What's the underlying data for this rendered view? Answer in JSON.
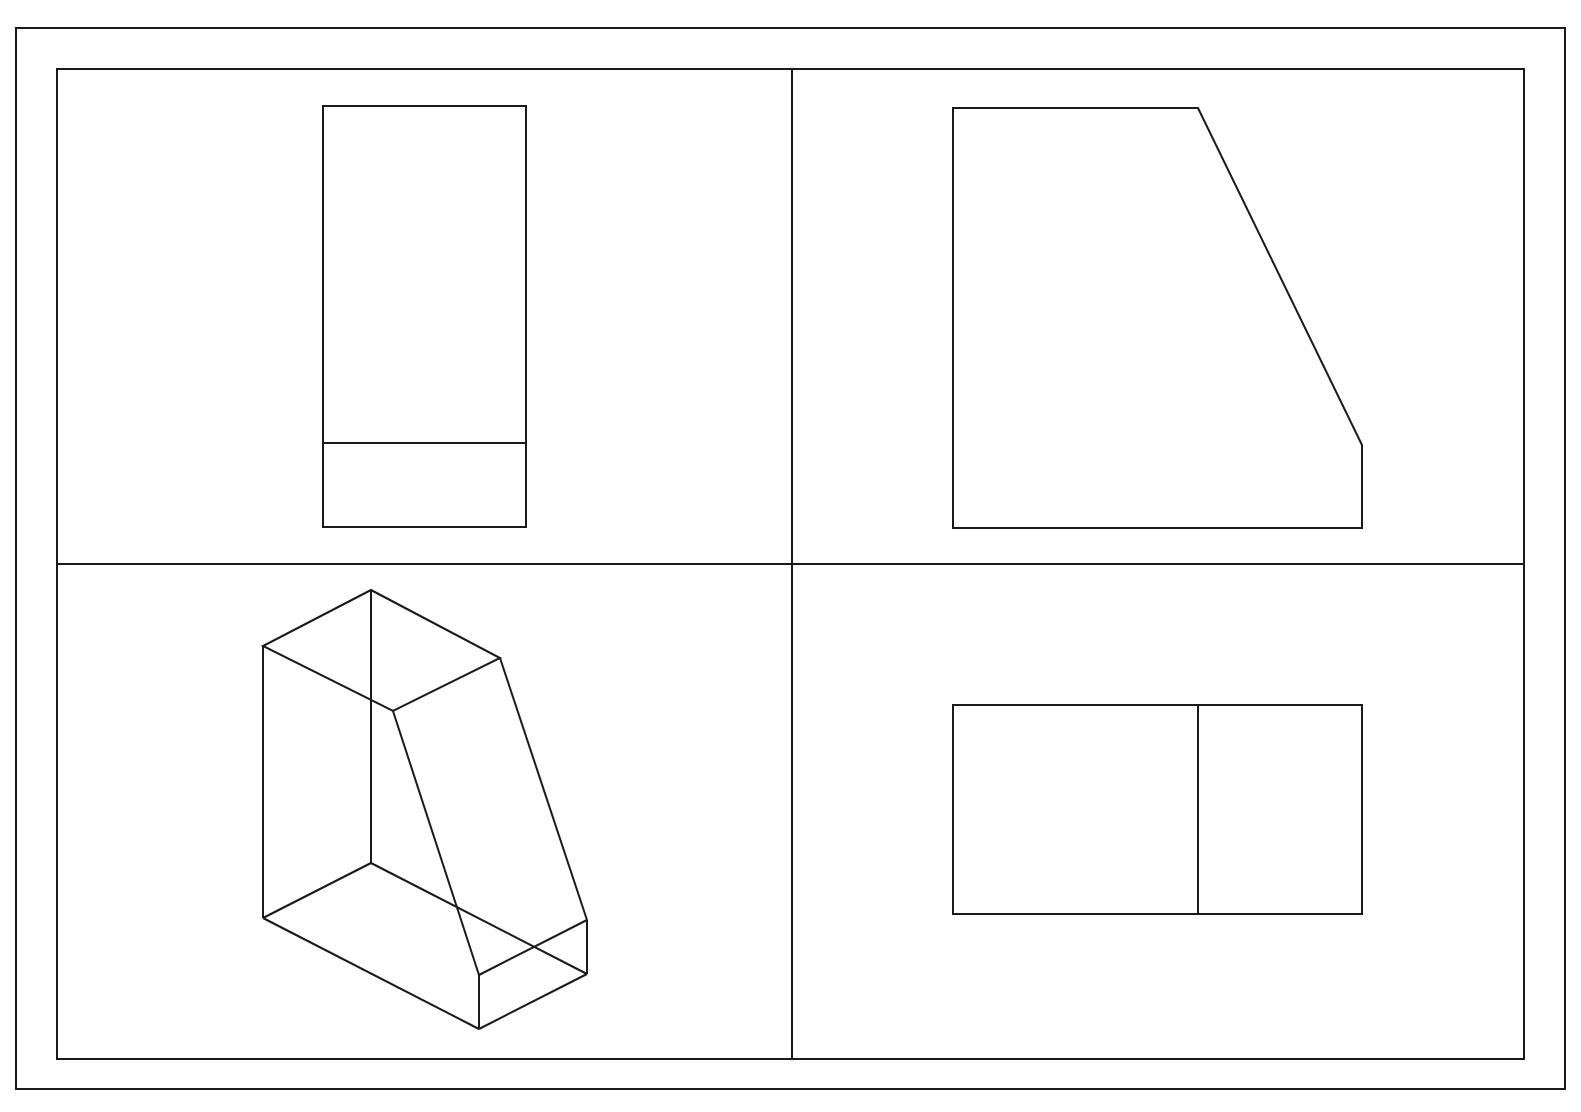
{
  "drawing": {
    "stroke_color": "#1a1a1a",
    "background": "#ffffff",
    "outer_frame": {
      "x": 16,
      "y": 28,
      "w": 1549,
      "h": 1061
    },
    "inner_frame": {
      "x": 57,
      "y": 69,
      "w": 1467,
      "h": 990
    },
    "dividers": {
      "vertical_x": 792,
      "horizontal_y": 564
    },
    "quadrants": [
      {
        "name": "front-view",
        "position": "top-left"
      },
      {
        "name": "side-view",
        "position": "top-right"
      },
      {
        "name": "isometric-view",
        "position": "bottom-left"
      },
      {
        "name": "top-view",
        "position": "bottom-right"
      }
    ]
  }
}
